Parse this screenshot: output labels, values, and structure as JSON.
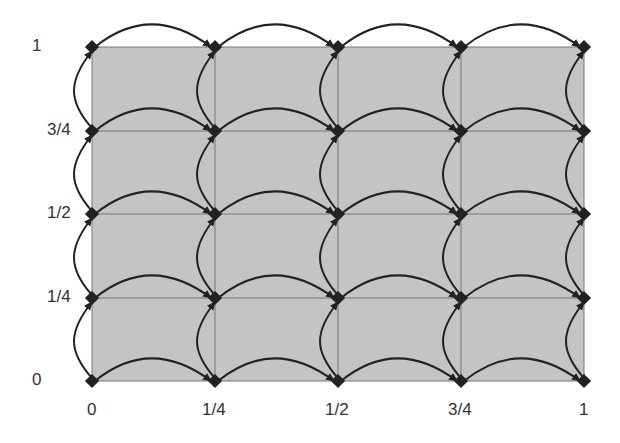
{
  "diagram": {
    "type": "grid-graph",
    "x_labels": [
      "0",
      "1/4",
      "1/2",
      "3/4",
      "1"
    ],
    "y_labels": [
      "0",
      "1/4",
      "1/2",
      "3/4",
      "1"
    ],
    "grid": {
      "columns": 5,
      "rows": 5
    },
    "colors": {
      "fill": "#c4c4c4",
      "grid_line": "#777777",
      "arrow": "#222222",
      "node": "#222222"
    },
    "edges": "curved directed arcs from each node to its right neighbor and upper neighbor"
  }
}
